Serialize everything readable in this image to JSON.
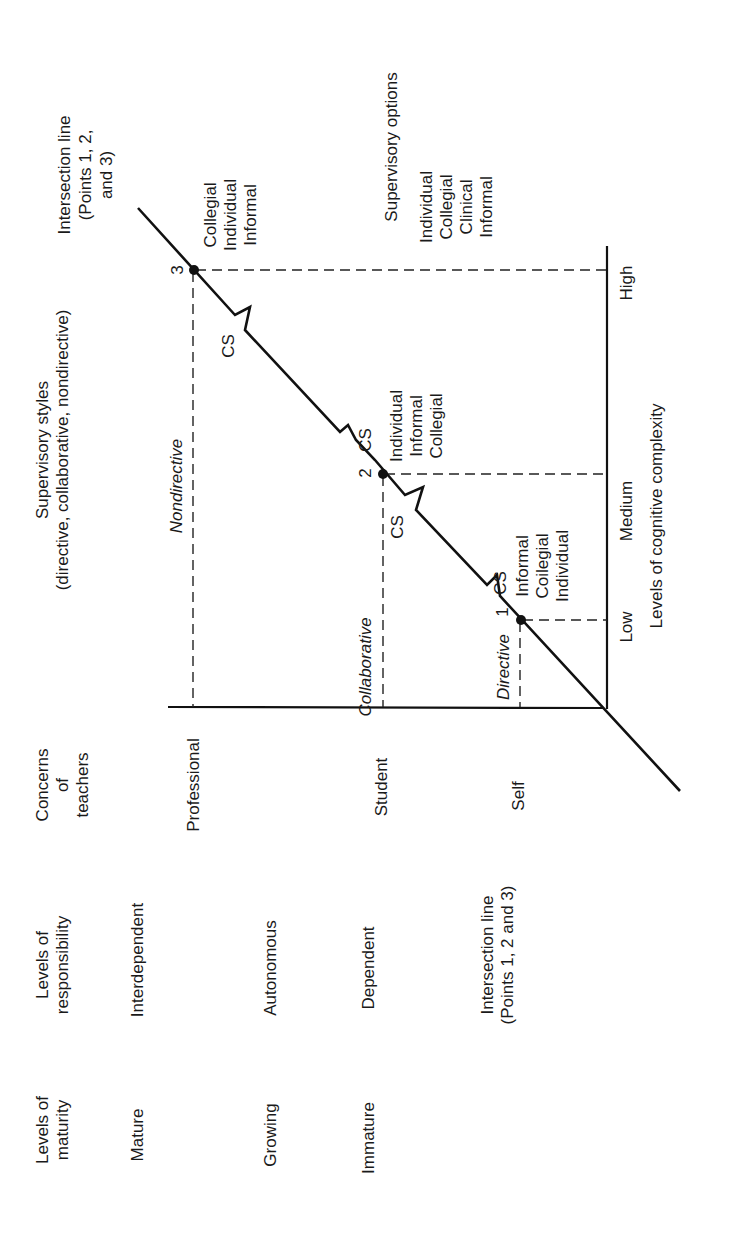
{
  "headers": {
    "maturity": [
      "Levels of",
      "maturity"
    ],
    "responsibility": [
      "Levels of",
      "responsibility"
    ],
    "concerns": [
      "Concerns",
      "of",
      "teachers"
    ],
    "styles": [
      "Supervisory styles",
      "(directive, collaborative, nondirective)"
    ],
    "intersection_top": [
      "Intersection line",
      "(Points 1, 2,",
      "and 3)"
    ],
    "intersection_bottom": [
      "Intersection line",
      "(Points 1, 2 and 3)"
    ],
    "options": "Supervisory options",
    "complexity_axis": "Levels of cognitive complexity"
  },
  "rows": [
    {
      "maturity": "Mature",
      "responsibility": "Interdependent",
      "concern": "Professional"
    },
    {
      "maturity": "Growing",
      "responsibility": "Autonomous",
      "concern": "Student"
    },
    {
      "maturity": "Immature",
      "responsibility": "Dependent",
      "concern": "Self"
    }
  ],
  "styles": {
    "directive": "Directive",
    "collaborative": "Collaborative",
    "nondirective": "Nondirective"
  },
  "complexity_levels": [
    "Low",
    "Medium",
    "High"
  ],
  "points": [
    {
      "label": "1",
      "options": [
        "Informal",
        "Coilegial",
        "Individual"
      ]
    },
    {
      "label": "2",
      "options": [
        "Individual",
        "Informal",
        "Collegial"
      ]
    },
    {
      "label": "3",
      "options": [
        "Collegial",
        "Individual",
        "Informal"
      ]
    }
  ],
  "cs_label": "CS",
  "supervisory_options_list": [
    "Individual",
    "Collegial",
    "Clinical",
    "Informal"
  ]
}
